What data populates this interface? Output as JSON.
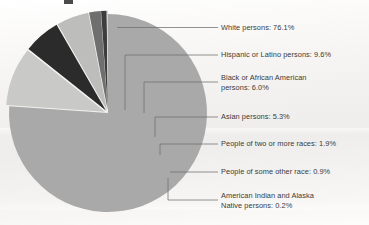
{
  "chart_data": {
    "type": "pie",
    "title": "",
    "subtitle": "",
    "xlabel": "",
    "ylabel": "",
    "legend_position": "right-callout-labels",
    "grid": false,
    "units": "percent",
    "categories": [
      "White persons",
      "Hispanic or Latino persons",
      "Black or African American persons",
      "Asian persons",
      "People of two or more races",
      "People of some other race",
      "American Indian and Alaska Native persons"
    ],
    "values": [
      76.1,
      9.6,
      6.0,
      5.3,
      1.9,
      0.9,
      0.2
    ],
    "slices": [
      {
        "label": "White persons: 76.1%",
        "name": "White persons",
        "value": 76.1,
        "color": "#a9a9a9",
        "exploded": false
      },
      {
        "label": "Hispanic or Latino persons: 9.6%",
        "name": "Hispanic or Latino persons",
        "value": 9.6,
        "color": "#c9c9c7",
        "exploded": true
      },
      {
        "label": "Black or African American persons: 6.0%",
        "label_line_1": "Black or African American",
        "label_line_2": "persons: 6.0%",
        "name": "Black or African American persons",
        "value": 6.0,
        "color": "#2b2b2b",
        "exploded": true
      },
      {
        "label": "Asian persons: 5.3%",
        "name": "Asian persons",
        "value": 5.3,
        "color": "#bdbdbb",
        "exploded": true
      },
      {
        "label": "People of two or more races: 1.9%",
        "name": "People of two or more races",
        "value": 1.9,
        "color": "#6f6f6f",
        "exploded": true
      },
      {
        "label": "People of some other race: 0.9%",
        "name": "People of some other race",
        "value": 0.9,
        "color": "#3d3d3d",
        "exploded": true
      },
      {
        "label": "American Indian and Alaska Native persons: 0.2%",
        "label_line_1": "American Indian and Alaska",
        "label_line_2": "Native persons: 0.2%",
        "name": "American Indian and Alaska Native persons",
        "value": 0.2,
        "color": "#d2d2d0",
        "exploded": true
      }
    ]
  },
  "labels": {
    "white": "White persons: 76.1%",
    "hispanic": "Hispanic or Latino persons: 9.6%",
    "black_line1": "Black or African American",
    "black_line2": "persons: 6.0%",
    "asian": "Asian persons: 5.3%",
    "two_or_more": "People of two or more races: 1.9%",
    "some_other": "People of some other race: 0.9%",
    "native_line1": "American Indian and Alaska",
    "native_line2": "Native persons: 0.2%"
  },
  "colors": {
    "background": "#f3f2f0",
    "text": "#3a3a3a",
    "leader_line": "#6d6d6d",
    "slice_white": "#a9a9a9",
    "slice_hispanic": "#c9c9c7",
    "slice_black": "#2b2b2b",
    "slice_asian": "#bdbdbb",
    "slice_two_or_more": "#6f6f6f",
    "slice_some_other": "#3d3d3d",
    "slice_native": "#d2d2d0"
  }
}
